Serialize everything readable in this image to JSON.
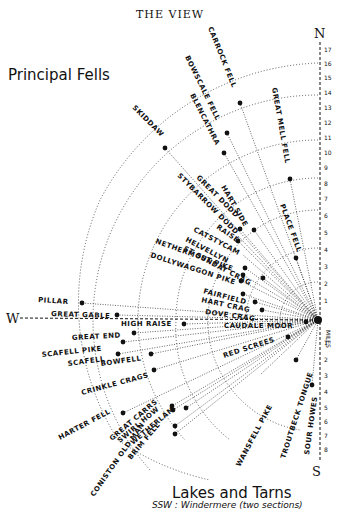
{
  "header": {
    "title": "THE VIEW",
    "section_top": "Principal Fells",
    "section_bottom": "Lakes and Tarns",
    "bottom_note": "SSW : Windermere (two sections)"
  },
  "compass": {
    "north": "N",
    "south": "S",
    "west": "W",
    "miles_label": "MILES"
  },
  "scale": {
    "north_ticks": [
      "1",
      "2",
      "3",
      "4",
      "5",
      "6",
      "7",
      "8",
      "9",
      "10",
      "11",
      "12",
      "13",
      "14",
      "15",
      "16",
      "17"
    ],
    "south_ticks": [
      "1",
      "2",
      "3",
      "4",
      "5",
      "6",
      "7",
      "8"
    ]
  },
  "fells": [
    {
      "name": "CARROCK FELL"
    },
    {
      "name": "BOWSCALE FELL"
    },
    {
      "name": "BLENCATHRA"
    },
    {
      "name": "SKIDDAW"
    },
    {
      "name": "GREAT MELL FELL"
    },
    {
      "name": "GREAT DODD"
    },
    {
      "name": "STYBARROW DODD"
    },
    {
      "name": "HART SIDE"
    },
    {
      "name": "RAISE"
    },
    {
      "name": "PLACE FELL"
    },
    {
      "name": "CATSTYCAM"
    },
    {
      "name": "HELVELLYN"
    },
    {
      "name": "ST SUNDAY CRAG"
    },
    {
      "name": "NETHERMOST PIKE"
    },
    {
      "name": "DOLLYWAGGON PIKE"
    },
    {
      "name": "FAIRFIELD"
    },
    {
      "name": "HART CRAG"
    },
    {
      "name": "DOVE CRAG"
    },
    {
      "name": "PILLAR"
    },
    {
      "name": "GREAT GABLE"
    },
    {
      "name": "HIGH RAISE"
    },
    {
      "name": "CAUDALE MOOR"
    },
    {
      "name": "GREAT END"
    },
    {
      "name": "SCAFELL PIKE"
    },
    {
      "name": "SCAFELL"
    },
    {
      "name": "BOWFELL"
    },
    {
      "name": "RED SCREES"
    },
    {
      "name": "CRINKLE CRAGS"
    },
    {
      "name": "HARTER FELL"
    },
    {
      "name": "GREAT CARRS"
    },
    {
      "name": "SWIRL HOW"
    },
    {
      "name": "WETHERLAM"
    },
    {
      "name": "BRIM FELL"
    },
    {
      "name": "CONISTON OLD MAN"
    },
    {
      "name": "WANSFELL PIKE"
    },
    {
      "name": "TROUTBECK TONGUE"
    },
    {
      "name": "SOUR HOWES"
    }
  ]
}
